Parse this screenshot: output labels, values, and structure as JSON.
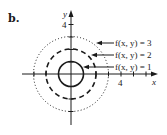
{
  "panel": {
    "label": "b."
  },
  "axes": {
    "x_label": "x",
    "y_label": "y",
    "x_tick_label": "4",
    "y_tick_label": "4"
  },
  "level_curves": [
    {
      "label": "f(x, y) = 3",
      "value": 3,
      "radius": 3,
      "style": "dotted"
    },
    {
      "label": "f(x, y) = 2",
      "value": 2,
      "radius": 2,
      "style": "dashed"
    },
    {
      "label": "f(x, y) = 1",
      "value": 1,
      "radius": 1,
      "style": "solid"
    }
  ],
  "colors": {
    "stroke": "#1a1a1a",
    "background": "#ffffff"
  }
}
